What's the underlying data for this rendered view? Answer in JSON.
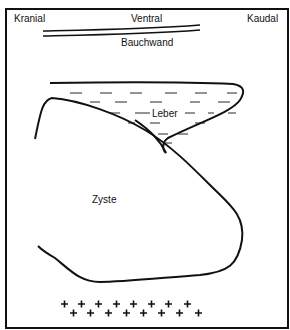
{
  "labels": {
    "kranial": "Kranial",
    "ventral": "Ventral",
    "kaudal": "Kaudal",
    "bauchwand": "Bauchwand",
    "leber": "Leber",
    "zyste": "Zyste"
  },
  "colors": {
    "stroke": "#111111",
    "background": "#ffffff"
  }
}
